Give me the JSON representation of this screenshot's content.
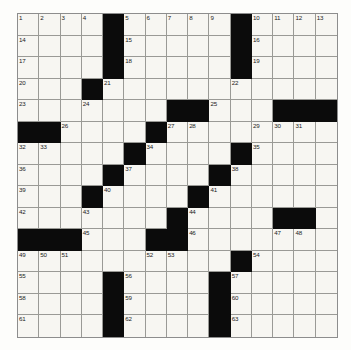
{
  "document": {
    "type": "crossword-puzzle",
    "title": "Crossword Puzzle Grid",
    "grid": {
      "columns": 15,
      "rows": 15,
      "background_color": "#fdfdfb",
      "cell_fill_color": "#f7f6f2",
      "block_color": "#0b0b0b",
      "line_color": "#9a9a96",
      "highest_clue_number": 63
    },
    "cells": [
      [
        {
          "n": "1"
        },
        {
          "n": "2"
        },
        {
          "n": "3"
        },
        {
          "n": "4"
        },
        {
          "b": true
        },
        {
          "n": "5"
        },
        {
          "n": "6"
        },
        {
          "n": "7"
        },
        {
          "n": "8"
        },
        {
          "n": "9"
        },
        {
          "b": true
        },
        {
          "n": "10"
        },
        {
          "n": "11"
        },
        {
          "n": "12"
        },
        {
          "n": "13"
        }
      ],
      [
        {
          "n": "14"
        },
        {},
        {},
        {},
        {
          "b": true
        },
        {
          "n": "15"
        },
        {},
        {},
        {},
        {},
        {
          "b": true
        },
        {
          "n": "16"
        },
        {},
        {},
        {}
      ],
      [
        {
          "n": "17"
        },
        {},
        {},
        {},
        {
          "b": true
        },
        {
          "n": "18"
        },
        {},
        {},
        {},
        {},
        {
          "b": true
        },
        {
          "n": "19"
        },
        {},
        {},
        {}
      ],
      [
        {
          "n": "20"
        },
        {},
        {},
        {
          "b": true
        },
        {
          "n": "21"
        },
        {},
        {},
        {},
        {},
        {},
        {
          "n": "22"
        },
        {},
        {},
        {},
        {}
      ],
      [
        {
          "n": "23"
        },
        {},
        {},
        {
          "n": "24"
        },
        {},
        {},
        {},
        {
          "b": true
        },
        {
          "b": true
        },
        {
          "n": "25"
        },
        {},
        {},
        {
          "b": true
        },
        {
          "b": true
        },
        {
          "b": true
        }
      ],
      [
        {
          "b": true
        },
        {
          "b": true
        },
        {
          "n": "26"
        },
        {},
        {},
        {},
        {
          "b": true
        },
        {
          "n": "27"
        },
        {
          "n": "28"
        },
        {},
        {},
        {
          "n": "29"
        },
        {
          "n": "30"
        },
        {
          "n": "31"
        },
        {}
      ],
      [
        {
          "n": "32"
        },
        {
          "n": "33"
        },
        {},
        {},
        {},
        {
          "b": true
        },
        {
          "n": "34"
        },
        {},
        {},
        {},
        {
          "b": true
        },
        {
          "n": "35"
        },
        {},
        {},
        {}
      ],
      [
        {
          "n": "36"
        },
        {},
        {},
        {},
        {
          "b": true
        },
        {
          "n": "37"
        },
        {},
        {},
        {},
        {
          "b": true
        },
        {
          "n": "38"
        },
        {},
        {},
        {},
        {}
      ],
      [
        {
          "n": "39"
        },
        {},
        {},
        {
          "b": true
        },
        {
          "n": "40"
        },
        {},
        {},
        {},
        {
          "b": true
        },
        {
          "n": "41"
        },
        {},
        {},
        {},
        {},
        {}
      ],
      [
        {
          "n": "42"
        },
        {},
        {},
        {
          "n": "43"
        },
        {},
        {},
        {},
        {
          "b": true
        },
        {
          "n": "44"
        },
        {},
        {},
        {},
        {
          "b": true
        },
        {
          "b": true
        },
        {}
      ],
      [
        {
          "b": true
        },
        {
          "b": true
        },
        {
          "b": true
        },
        {
          "n": "45"
        },
        {},
        {},
        {
          "b": true
        },
        {
          "b": true
        },
        {
          "n": "46"
        },
        {},
        {},
        {},
        {
          "n": "47"
        },
        {
          "n": "48"
        },
        {}
      ],
      [
        {
          "n": "49"
        },
        {
          "n": "50"
        },
        {
          "n": "51"
        },
        {},
        {},
        {},
        {
          "n": "52"
        },
        {
          "n": "53"
        },
        {},
        {},
        {
          "b": true
        },
        {
          "n": "54"
        },
        {},
        {},
        {}
      ],
      [
        {
          "n": "55"
        },
        {},
        {},
        {},
        {
          "b": true
        },
        {
          "n": "56"
        },
        {},
        {},
        {},
        {
          "b": true
        },
        {
          "n": "57"
        },
        {},
        {},
        {},
        {}
      ],
      [
        {
          "n": "58"
        },
        {},
        {},
        {},
        {
          "b": true
        },
        {
          "n": "59"
        },
        {},
        {},
        {},
        {
          "b": true
        },
        {
          "n": "60"
        },
        {},
        {},
        {},
        {}
      ],
      [
        {
          "n": "61"
        },
        {},
        {},
        {},
        {
          "b": true
        },
        {
          "n": "62"
        },
        {},
        {},
        {},
        {
          "b": true
        },
        {
          "n": "63"
        },
        {},
        {},
        {},
        {}
      ]
    ]
  }
}
